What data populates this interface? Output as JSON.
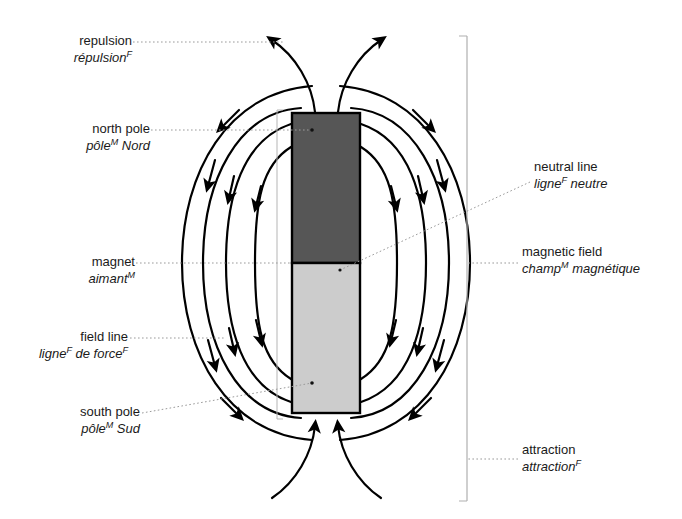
{
  "diagram": {
    "magnet": {
      "north_color": "#565656",
      "south_color": "#cccccc",
      "outline_color": "#000000"
    },
    "field_line_color": "#000000",
    "leader_color": "#8a8a8a",
    "bracket_color": "#b0b0b0"
  },
  "labels": {
    "repulsion": {
      "en": "repulsion",
      "fr_pre": "répulsion",
      "fr_sup": "F",
      "fr_post": ""
    },
    "north_pole": {
      "en": "north pole",
      "fr_pre": "pôle",
      "fr_sup": "M",
      "fr_post": " Nord"
    },
    "magnet": {
      "en": "magnet",
      "fr_pre": "aimant",
      "fr_sup": "M",
      "fr_post": ""
    },
    "field_line": {
      "en": "field line",
      "fr_pre": "ligne",
      "fr_sup": "F",
      "fr_post": " de force",
      "fr_sup2": "F"
    },
    "south_pole": {
      "en": "south pole",
      "fr_pre": "pôle",
      "fr_sup": "M",
      "fr_post": " Sud"
    },
    "neutral_line": {
      "en": "neutral line",
      "fr_pre": "ligne",
      "fr_sup": "F",
      "fr_post": " neutre"
    },
    "magnetic_field": {
      "en": "magnetic field",
      "fr_pre": "champ",
      "fr_sup": "M",
      "fr_post": " magnétique"
    },
    "attraction": {
      "en": "attraction",
      "fr_pre": "attraction",
      "fr_sup": "F",
      "fr_post": ""
    }
  }
}
